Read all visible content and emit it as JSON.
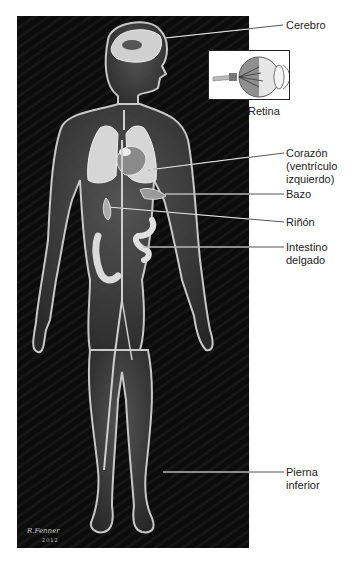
{
  "figure": {
    "background_color": "#0b0b0b",
    "body_glow_color": "#d8d8d8",
    "signature": "R.Fenner",
    "signature_year": "2012"
  },
  "inset": {
    "name": "eye-cross-section",
    "label": "Retina"
  },
  "labels": [
    {
      "id": "cerebro",
      "text": "Cerebro"
    },
    {
      "id": "corazon",
      "text": "Corazón\n(ventrículo\nizquierdo)"
    },
    {
      "id": "bazo",
      "text": "Bazo"
    },
    {
      "id": "rinon",
      "text": "Riñón"
    },
    {
      "id": "intestino",
      "text": "Intestino\ndelgado"
    },
    {
      "id": "pierna",
      "text": "Pierna\ninferior"
    }
  ]
}
